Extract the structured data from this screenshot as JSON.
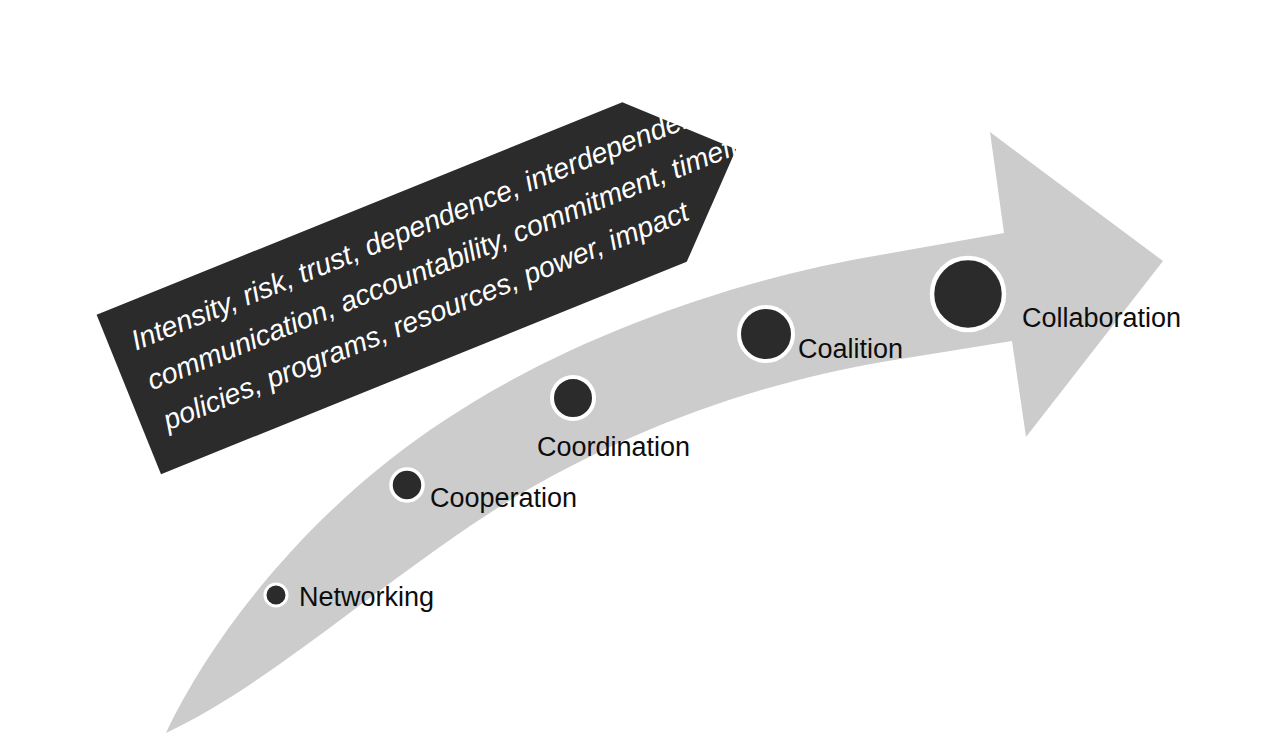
{
  "figure": {
    "background_color": "#ffffff"
  },
  "colors": {
    "banner_fill": "#2b2b2b",
    "banner_text": "#ffffff",
    "arrow_fill": "#cccccc",
    "node_fill": "#2b2b2b",
    "node_ring": "#ffffff",
    "label_text": "#0d0d0d"
  },
  "banner": {
    "name": "factors-banner",
    "shape": "pentagon-arrow-right",
    "rotation_degrees": -22,
    "lines": [
      "Intensity, risk, trust, dependence, interdependence,",
      "communication, accountability, commitment, timeframe,",
      "policies, programs, resources, power, impact"
    ]
  },
  "arrow": {
    "name": "progression-arrow",
    "direction": "up-right",
    "description": "curved tapering arrow widening from lower-left to upper-right"
  },
  "stages": [
    {
      "id": "networking",
      "label": "Networking",
      "order": 1,
      "node_radius": 11,
      "node_cx": 276,
      "node_cy": 595,
      "label_x": 299,
      "label_y": 606
    },
    {
      "id": "cooperation",
      "label": "Cooperation",
      "order": 2,
      "node_radius": 16,
      "node_cx": 407,
      "node_cy": 485,
      "label_x": 430,
      "label_y": 507
    },
    {
      "id": "coordination",
      "label": "Coordination",
      "order": 3,
      "node_radius": 21,
      "node_cx": 573,
      "node_cy": 398,
      "label_x": 537,
      "label_y": 456
    },
    {
      "id": "coalition",
      "label": "Coalition",
      "order": 4,
      "node_radius": 27,
      "node_cx": 766,
      "node_cy": 334,
      "label_x": 798,
      "label_y": 358
    },
    {
      "id": "collaboration",
      "label": "Collaboration",
      "order": 5,
      "node_radius": 36,
      "node_cx": 968,
      "node_cy": 294,
      "label_x": 1022,
      "label_y": 327
    }
  ]
}
